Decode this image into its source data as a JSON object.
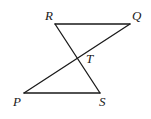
{
  "figure": {
    "type": "geometry",
    "points": {
      "R": {
        "label": "R",
        "x": 55,
        "y": 24,
        "label_x": 45,
        "label_y": 20
      },
      "Q": {
        "label": "Q",
        "x": 130,
        "y": 24,
        "label_x": 132,
        "label_y": 20
      },
      "P": {
        "label": "P",
        "x": 24,
        "y": 93,
        "label_x": 13,
        "label_y": 106
      },
      "S": {
        "label": "S",
        "x": 100,
        "y": 93,
        "label_x": 99,
        "label_y": 106
      },
      "T": {
        "label": "T",
        "x": 77,
        "y": 59,
        "label_x": 86,
        "label_y": 63
      }
    },
    "segments": [
      {
        "name": "RQ",
        "from": "R",
        "to": "Q"
      },
      {
        "name": "PS",
        "from": "P",
        "to": "S"
      },
      {
        "name": "RS",
        "from": "R",
        "to": "S"
      },
      {
        "name": "PQ",
        "from": "P",
        "to": "Q"
      }
    ],
    "stroke_color": "#1a1a1a"
  }
}
